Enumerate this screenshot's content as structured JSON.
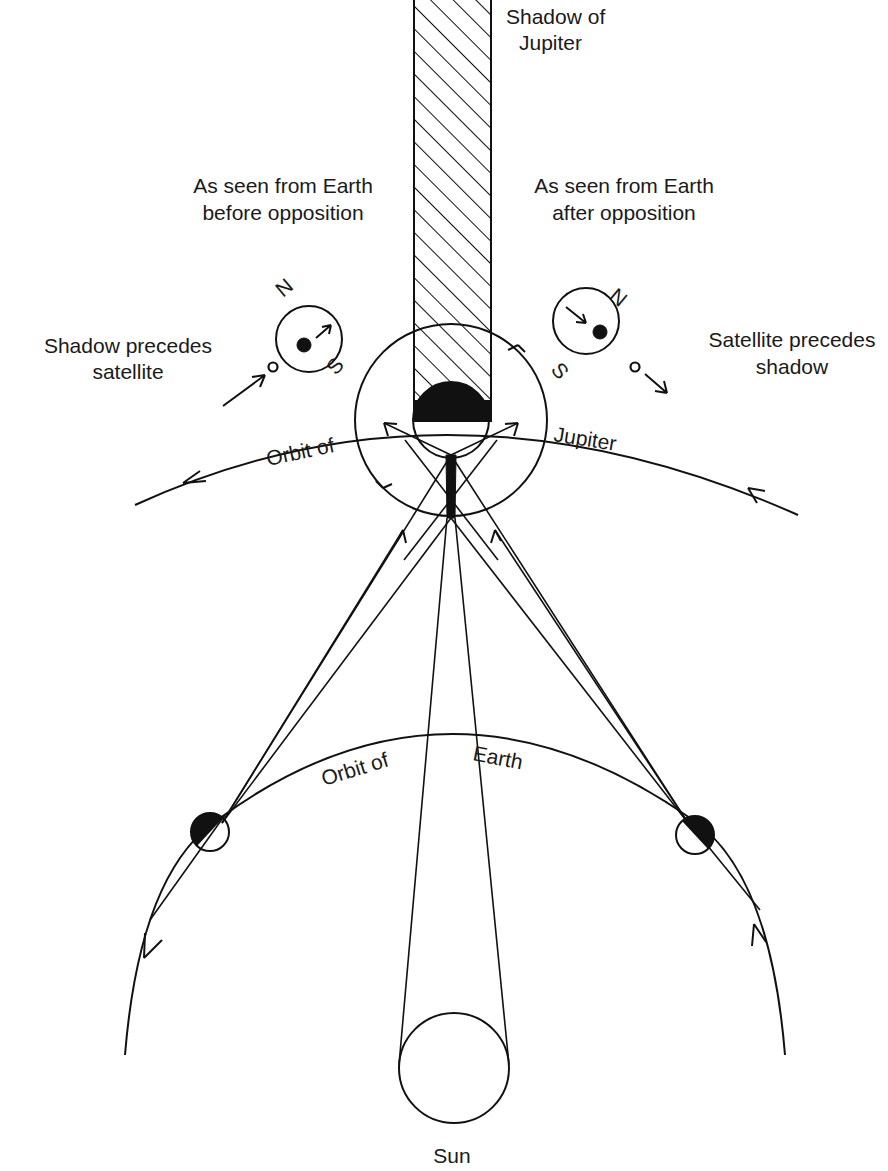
{
  "figure": {
    "type": "astronomical-geometry-diagram"
  },
  "labels": {
    "shadow_of_jupiter_line1": "Shadow of",
    "shadow_of_jupiter_line2": "Jupiter",
    "before_line1": "As seen from Earth",
    "before_line2": "before opposition",
    "after_line1": "As seen from Earth",
    "after_line2": "after opposition",
    "shadow_precedes_line1": "Shadow precedes",
    "shadow_precedes_line2": "satellite",
    "satellite_precedes_line1": "Satellite precedes",
    "satellite_precedes_line2": "shadow",
    "orbit_jupiter_left": "Orbit of",
    "orbit_jupiter_right": "Jupiter",
    "orbit_earth_left": "Orbit of",
    "orbit_earth_right": "Earth",
    "sun": "Sun",
    "north_left": "N",
    "south_left": "S",
    "north_right": "N",
    "south_right": "S"
  },
  "colors": {
    "ink": "#111111",
    "background": "#ffffff"
  }
}
